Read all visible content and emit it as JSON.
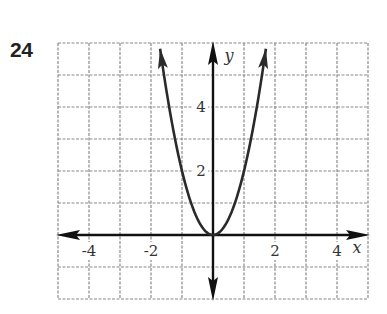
{
  "problem": {
    "number": "24"
  },
  "chart_data": {
    "type": "line",
    "title": "",
    "function": "y = 2x^2",
    "xlabel": "x",
    "ylabel": "y",
    "xlim": [
      -5,
      5
    ],
    "ylim": [
      -2,
      6
    ],
    "grid": true,
    "grid_style": "dashed",
    "x_tick_labels": [
      "-4",
      "-2",
      "2",
      "4"
    ],
    "x_tick_values": [
      -4,
      -2,
      2,
      4
    ],
    "y_tick_labels": [
      "2",
      "4"
    ],
    "y_tick_values": [
      2,
      4
    ],
    "series": [
      {
        "name": "parabola",
        "x": [
          -1.71,
          -1.5,
          -1,
          -0.5,
          0,
          0.5,
          1,
          1.5,
          1.71
        ],
        "y": [
          5.85,
          4.5,
          2,
          0.5,
          0,
          0.5,
          2,
          4.5,
          5.85
        ],
        "arrows_at_ends": true
      }
    ]
  }
}
